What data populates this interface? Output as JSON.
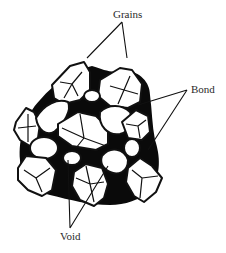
{
  "diagram": {
    "labels": {
      "grains": "Grains",
      "bond": "Bond",
      "void": "Void"
    },
    "colors": {
      "bond_fill": "#0a0a0a",
      "grain_fill": "#ffffff",
      "line": "#111111",
      "text": "#2a2a2a"
    }
  }
}
